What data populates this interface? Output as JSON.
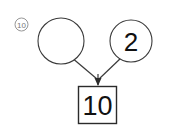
{
  "diagram": {
    "type": "number-bond",
    "problem_marker": "10",
    "parts": [
      {
        "id": "left-part",
        "value": "",
        "filled": false
      },
      {
        "id": "right-part",
        "value": "2",
        "filled": true
      }
    ],
    "total": {
      "id": "total-box",
      "value": "10"
    },
    "colors": {
      "background": "#ffffff",
      "circle_stroke": "#3a3a3a",
      "box_stroke": "#2b2b2b",
      "connector": "#3a3a3a",
      "text": "#111111",
      "marker": "#7a7a7a"
    }
  }
}
